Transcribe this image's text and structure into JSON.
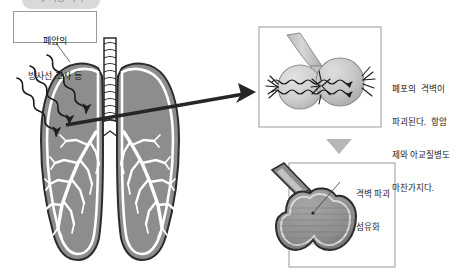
{
  "diagram": {
    "title_tag": "폐 기능 저하",
    "callout": {
      "lines": [
        "폐암의",
        "방사선 조사 등"
      ]
    },
    "left_figure": {
      "name": "lungs-anatomy",
      "parts": [
        "trachea",
        "left-lung",
        "right-lung",
        "bronchial-tree"
      ],
      "radiation_arrows": 3
    },
    "panels": [
      {
        "id": "alveoli-damage",
        "caption_lines": [
          "폐포의  격벽이",
          "파괴된다.  항암",
          "제와 아교질병도",
          "마찬가지다."
        ]
      },
      {
        "id": "alveoli-fibrosis",
        "caption_lines": [
          "격벽 파괴",
          "섬유화"
        ]
      }
    ],
    "arrows": {
      "right_arrow": "arrow-right",
      "down_arrow": "arrow-down"
    },
    "colors": {
      "lung_fill": "#8d8d8d",
      "lung_outline": "#2b2b2b",
      "panel_border": "#9a9a9a",
      "alveoli_fill": "#c9c9c9",
      "fibrosis_fill": "#8e8e8e",
      "background": "#ffffff",
      "tag_bg": "#d9d9d9"
    }
  }
}
